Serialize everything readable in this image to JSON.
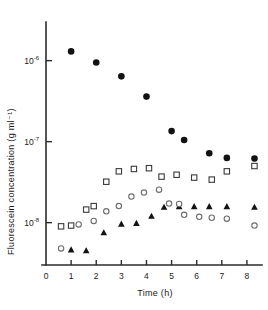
{
  "chart_data": {
    "type": "scatter",
    "title": "",
    "xlabel": "Time (h)",
    "ylabel": "Fluorescein concentration (g ml⁻¹)",
    "yscale": "log",
    "xlim": [
      0,
      8.6
    ],
    "ylim": [
      3e-09,
      3e-06
    ],
    "grid": false,
    "legend_position": "none",
    "x_ticks": [
      0,
      1,
      2,
      3,
      4,
      5,
      6,
      7,
      8
    ],
    "x_tick_labels": [
      "0",
      "1",
      "2",
      "3",
      "4",
      "5",
      "6",
      "7",
      "8"
    ],
    "y_ticks": [
      1e-06,
      1e-07,
      1e-08
    ],
    "y_tick_labels": [
      "10⁻⁶",
      "10⁻⁷",
      "10⁻⁸"
    ],
    "y_tick_mantissas": [
      "10",
      "10",
      "10"
    ],
    "y_tick_exponents": [
      "-6",
      "-7",
      "-8"
    ],
    "series": [
      {
        "name": "filled-circle",
        "marker": "filled-circle",
        "color": "#121212",
        "points": [
          {
            "x": 1.0,
            "y": 1.3e-06
          },
          {
            "x": 2.0,
            "y": 9.5e-07
          },
          {
            "x": 3.0,
            "y": 6.4e-07
          },
          {
            "x": 4.0,
            "y": 3.6e-07
          },
          {
            "x": 5.0,
            "y": 1.35e-07
          },
          {
            "x": 5.5,
            "y": 1.05e-07
          },
          {
            "x": 6.5,
            "y": 7.2e-08
          },
          {
            "x": 7.2,
            "y": 6.3e-08
          },
          {
            "x": 8.3,
            "y": 6.2e-08
          }
        ]
      },
      {
        "name": "open-square",
        "marker": "open-square",
        "color": "#3a3a3a",
        "points": [
          {
            "x": 0.6,
            "y": 9e-09
          },
          {
            "x": 1.0,
            "y": 9.2e-09
          },
          {
            "x": 1.6,
            "y": 1.45e-08
          },
          {
            "x": 1.9,
            "y": 1.6e-08
          },
          {
            "x": 2.4,
            "y": 3.2e-08
          },
          {
            "x": 2.9,
            "y": 4.3e-08
          },
          {
            "x": 3.5,
            "y": 4.6e-08
          },
          {
            "x": 4.1,
            "y": 4.7e-08
          },
          {
            "x": 4.6,
            "y": 3.7e-08
          },
          {
            "x": 5.2,
            "y": 3.9e-08
          },
          {
            "x": 5.9,
            "y": 3.6e-08
          },
          {
            "x": 6.6,
            "y": 3.4e-08
          },
          {
            "x": 7.2,
            "y": 4.3e-08
          },
          {
            "x": 8.3,
            "y": 5e-08
          }
        ]
      },
      {
        "name": "filled-triangle",
        "marker": "filled-triangle",
        "color": "#121212",
        "points": [
          {
            "x": 1.0,
            "y": 4.6e-09
          },
          {
            "x": 1.6,
            "y": 4.5e-09
          },
          {
            "x": 2.3,
            "y": 7.5e-09
          },
          {
            "x": 3.0,
            "y": 9.6e-09
          },
          {
            "x": 3.6,
            "y": 9.8e-09
          },
          {
            "x": 4.2,
            "y": 1.2e-08
          },
          {
            "x": 4.7,
            "y": 1.55e-08
          },
          {
            "x": 5.3,
            "y": 1.58e-08
          },
          {
            "x": 5.9,
            "y": 1.58e-08
          },
          {
            "x": 6.5,
            "y": 1.58e-08
          },
          {
            "x": 7.2,
            "y": 1.58e-08
          },
          {
            "x": 8.3,
            "y": 1.55e-08
          }
        ]
      },
      {
        "name": "open-circle",
        "marker": "open-circle",
        "color": "#6e6e6e",
        "points": [
          {
            "x": 0.6,
            "y": 4.8e-09
          },
          {
            "x": 1.3,
            "y": 9.5e-09
          },
          {
            "x": 1.9,
            "y": 1.05e-08
          },
          {
            "x": 2.4,
            "y": 1.38e-08
          },
          {
            "x": 2.9,
            "y": 1.6e-08
          },
          {
            "x": 3.4,
            "y": 2.1e-08
          },
          {
            "x": 3.9,
            "y": 2.35e-08
          },
          {
            "x": 4.5,
            "y": 2.55e-08
          },
          {
            "x": 4.9,
            "y": 1.72e-08
          },
          {
            "x": 5.3,
            "y": 1.7e-08
          },
          {
            "x": 5.5,
            "y": 1.25e-08
          },
          {
            "x": 6.1,
            "y": 1.18e-08
          },
          {
            "x": 6.6,
            "y": 1.15e-08
          },
          {
            "x": 7.2,
            "y": 1.12e-08
          },
          {
            "x": 8.3,
            "y": 9.2e-09
          }
        ]
      }
    ]
  }
}
